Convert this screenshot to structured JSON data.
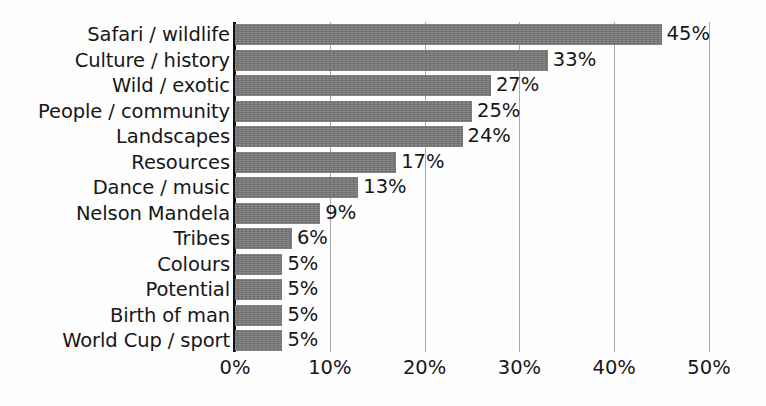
{
  "chart_data": {
    "type": "bar",
    "orientation": "horizontal",
    "title": "",
    "subtitle": "",
    "xlabel": "",
    "ylabel": "",
    "xlim": [
      0,
      50
    ],
    "grid": true,
    "legend": null,
    "legend_position": "none",
    "value_suffix": "%",
    "xticks": [
      0,
      10,
      20,
      30,
      40,
      50
    ],
    "xtick_labels": [
      "0%",
      "10%",
      "20%",
      "30%",
      "40%",
      "50%"
    ],
    "categories": [
      "Safari / wildlife",
      "Culture / history",
      "Wild / exotic",
      "People / community",
      "Landscapes",
      "Resources",
      "Dance / music",
      "Nelson Mandela",
      "Tribes",
      "Colours",
      "Potential",
      "Birth of man",
      "World Cup / sport"
    ],
    "values": [
      45,
      33,
      27,
      25,
      24,
      17,
      13,
      9,
      6,
      5,
      5,
      5,
      5
    ],
    "value_labels": [
      "45%",
      "33%",
      "27%",
      "25%",
      "24%",
      "17%",
      "13%",
      "9%",
      "6%",
      "5%",
      "5%",
      "5%",
      "5%"
    ]
  },
  "style": {
    "bar_color": "#767676",
    "gridline_color": "#a9a9a9",
    "axis_color": "#111111",
    "text_color": "#171717",
    "background_color": "#fefefe"
  }
}
